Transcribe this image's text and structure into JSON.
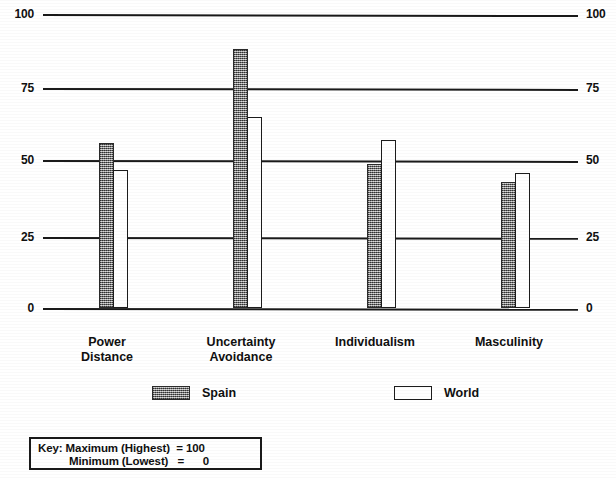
{
  "chart_data": {
    "type": "bar",
    "title": "",
    "xlabel": "",
    "ylabel": "",
    "ylim": [
      0,
      100
    ],
    "yticks": [
      0,
      25,
      50,
      75,
      100
    ],
    "grid": true,
    "legend_position": "below-axis",
    "dual_axis": true,
    "categories": [
      "Power Distance",
      "Uncertainty Avoidance",
      "Individualism",
      "Masculinity"
    ],
    "series": [
      {
        "name": "Spain",
        "values": [
          56,
          88,
          49,
          43
        ],
        "fill": "stippled-gray"
      },
      {
        "name": "World",
        "values": [
          47,
          65,
          57,
          46
        ],
        "fill": "white"
      }
    ]
  },
  "axis": {
    "left_ticks": [
      "100",
      "75",
      "50",
      "25",
      "0"
    ],
    "right_ticks": [
      "100",
      "75",
      "50",
      "25",
      "0"
    ]
  },
  "categories": [
    {
      "line1": "Power",
      "line2": "Distance"
    },
    {
      "line1": "Uncertainty",
      "line2": "Avoidance"
    },
    {
      "line1": "Individualism",
      "line2": ""
    },
    {
      "line1": "Masculinity",
      "line2": ""
    }
  ],
  "legend": {
    "entries": [
      {
        "label": "Spain",
        "swatch": "stippled-gray"
      },
      {
        "label": "World",
        "swatch": "white"
      }
    ]
  },
  "key": {
    "line1": "Key: Maximum (Highest)  = 100",
    "line2": "Minimum (Lowest)   =      0"
  },
  "colors": {
    "ink": "#1a1a1a",
    "spain_fill": "#8f8f8f",
    "world_fill": "#ffffff",
    "background": "#ffffff"
  }
}
